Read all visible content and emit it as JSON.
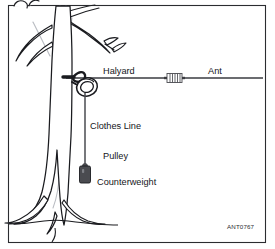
{
  "figure": {
    "reference_code": "ANT0767",
    "labels": {
      "halyard": "Halyard",
      "antenna": "Ant",
      "pulley_line1": "Clothes Line",
      "pulley_line2": "Pulley",
      "counterweight": "Counterweight"
    },
    "colors": {
      "border": "#2b2c30",
      "line": "#3a3b40",
      "outline": "#1a1b1f",
      "trunk_shade": "#b9bcc2",
      "weight_fill": "#4a4b50",
      "background": "#ffffff",
      "text": "#15161a"
    }
  }
}
